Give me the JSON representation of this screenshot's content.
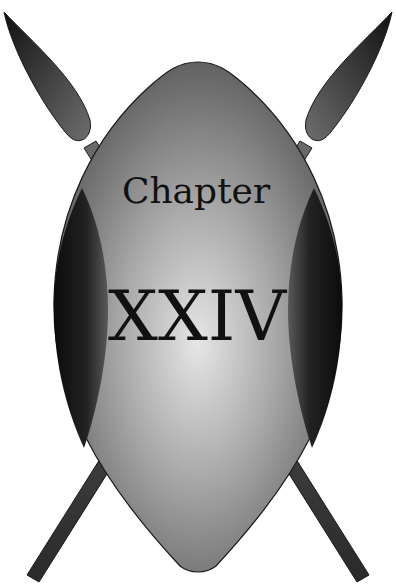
{
  "emblem": {
    "heading": "Chapter",
    "number": "XXIV"
  },
  "colors": {
    "background": "#ffffff",
    "outline": "#1a1a1a",
    "text": "#111111",
    "shield_light": "#e4e4e4",
    "shield_dark": "#555555",
    "side_panel_dark": "#0e0e0e",
    "spear_dark": "#1c1c1c",
    "spear_light": "#777777"
  }
}
